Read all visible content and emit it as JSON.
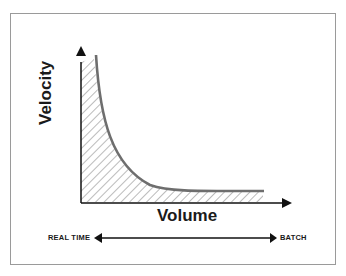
{
  "diagram": {
    "y_axis_label": "Velocity",
    "x_axis_label": "Volume",
    "spectrum": {
      "left_label": "REAL TIME",
      "right_label": "BATCH"
    },
    "curve": "decaying velocity vs. volume, area beneath hatched",
    "colors": {
      "curve": "#6e6e6e",
      "axes": "#111111",
      "hatch": "#777777",
      "frame": "#9a9a9a"
    }
  }
}
